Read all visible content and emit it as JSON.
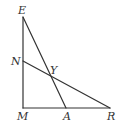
{
  "diagram": {
    "type": "geometry",
    "stroke_color": "#333333",
    "points": {
      "E": {
        "label": "E",
        "x": 23,
        "y": 17
      },
      "N": {
        "label": "N",
        "x": 23,
        "y": 61
      },
      "Y": {
        "label": "Y",
        "x": 52,
        "y": 77
      },
      "M": {
        "label": "M",
        "x": 23,
        "y": 108
      },
      "A": {
        "label": "A",
        "x": 66,
        "y": 108
      },
      "R": {
        "label": "R",
        "x": 110,
        "y": 108
      }
    },
    "segments": [
      {
        "from": "E",
        "to": "M"
      },
      {
        "from": "M",
        "to": "R"
      },
      {
        "from": "E",
        "to": "A"
      },
      {
        "from": "N",
        "to": "R"
      }
    ],
    "labels": {
      "E": "E",
      "N": "N",
      "Y": "Y",
      "M": "M",
      "A": "A",
      "R": "R"
    }
  }
}
